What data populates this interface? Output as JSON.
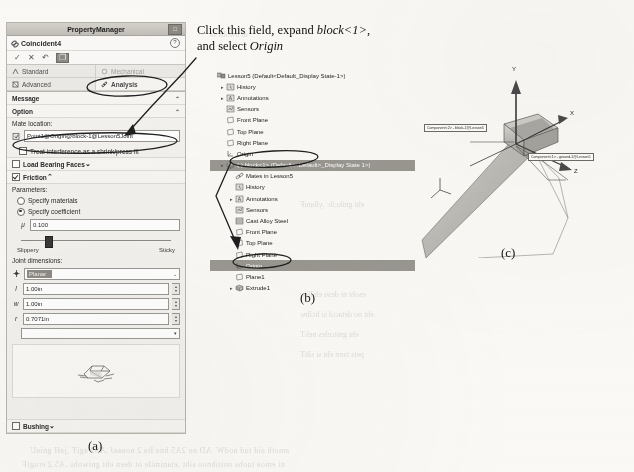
{
  "figure": {
    "caption_a": "(a)",
    "caption_b": "(b)",
    "caption_c": "(c)"
  },
  "instruction": {
    "line1_pre": "Click this field, expand ",
    "line1_em": "block<1>",
    "line1_post": ",",
    "line2_pre": "and select ",
    "line2_em": "Origin"
  },
  "property_manager": {
    "window_title": "PropertyManager",
    "pin_icon": "pin-icon",
    "mate_name": "Coincident4",
    "help_icon": "help-icon",
    "buttons": [
      {
        "name": "ok-button",
        "glyph": "✓"
      },
      {
        "name": "cancel-button",
        "glyph": "✕"
      },
      {
        "name": "undo-button",
        "glyph": "↶"
      },
      {
        "name": "mate-options-button",
        "glyph": "❐"
      }
    ],
    "tabs": [
      {
        "label": "Standard",
        "icon": "standard-mate-icon",
        "active": false
      },
      {
        "label": "Mechanical",
        "icon": "mechanical-mate-icon",
        "active": false
      },
      {
        "label": "Advanced",
        "icon": "advanced-mate-icon",
        "active": false
      },
      {
        "label": "Analysis",
        "icon": "analysis-mate-icon",
        "active": true
      }
    ],
    "message_section": {
      "title": "Message",
      "caret": "⌃"
    },
    "option_section": {
      "title": "Option",
      "caret": "⌃"
    },
    "mate_location": {
      "label": "Mate location:",
      "icon": "pick-location-icon",
      "value": "Point1@Origin@block-1@Lesson5Joint"
    },
    "shrink_fit": {
      "label": "Treat interference as a shrink/press fit",
      "checked": false
    },
    "load_bearing_faces": {
      "label": "Load Bearing Faces",
      "checked": false,
      "caret": "⌄"
    },
    "friction": {
      "label": "Friction",
      "checked": true,
      "caret": "⌃",
      "parameters_label": "Parameters:",
      "specify_materials": {
        "label": "Specify materials",
        "selected": false
      },
      "specify_coefficient": {
        "label": "Specify coefficient",
        "selected": true
      },
      "coefficient": {
        "symbol": "μ",
        "value": "0.100"
      },
      "slider": {
        "min_label": "Slippery",
        "max_label": "Sticky",
        "position_pct": 16
      }
    },
    "joint_dimensions": {
      "label": "Joint dimensions:",
      "type_icon": "joint-type-icon",
      "type_value": "Planar",
      "type_caret": "⌄",
      "fields": [
        {
          "symbol": "l",
          "value": "1.00in",
          "name": "length-field"
        },
        {
          "symbol": "w",
          "value": "1.00in",
          "name": "width-field"
        },
        {
          "symbol": "r",
          "value": "0.7071in",
          "name": "radius-field"
        }
      ]
    },
    "preview_icon": "joint-preview-thumbnail",
    "bushing": {
      "label": "Bushing",
      "checked": false,
      "caret": "⌄"
    }
  },
  "feature_tree": {
    "items": [
      {
        "indent": 0,
        "twisty": "",
        "icon": "assembly-icon",
        "label": "Lesson5  (Default<Default_Display State-1>)",
        "selected": false
      },
      {
        "indent": 1,
        "twisty": "▸",
        "icon": "history-icon",
        "label": "History",
        "selected": false
      },
      {
        "indent": 1,
        "twisty": "▸",
        "icon": "annotations-icon",
        "label": "Annotations",
        "selected": false
      },
      {
        "indent": 1,
        "twisty": "",
        "icon": "sensors-icon",
        "label": "Sensors",
        "selected": false
      },
      {
        "indent": 1,
        "twisty": "",
        "icon": "plane-icon",
        "label": "Front Plane",
        "selected": false
      },
      {
        "indent": 1,
        "twisty": "",
        "icon": "plane-icon",
        "label": "Top Plane",
        "selected": false
      },
      {
        "indent": 1,
        "twisty": "",
        "icon": "plane-icon",
        "label": "Right Plane",
        "selected": false
      },
      {
        "indent": 1,
        "twisty": "",
        "icon": "origin-icon",
        "label": "Origin",
        "selected": false
      },
      {
        "indent": 1,
        "twisty": "▸",
        "icon": "part-icon",
        "label": "(-) block<1>  (Default<<Default>_Display State 1>)",
        "selected": true
      },
      {
        "indent": 2,
        "twisty": "",
        "icon": "mates-icon",
        "label": "Mates in Lesson5",
        "selected": false
      },
      {
        "indent": 2,
        "twisty": "",
        "icon": "history-icon",
        "label": "History",
        "selected": false
      },
      {
        "indent": 2,
        "twisty": "▸",
        "icon": "annotations-icon",
        "label": "Annotations",
        "selected": false
      },
      {
        "indent": 2,
        "twisty": "",
        "icon": "sensors-icon",
        "label": "Sensors",
        "selected": false
      },
      {
        "indent": 2,
        "twisty": "",
        "icon": "material-icon",
        "label": "Cast Alloy Steel",
        "selected": false
      },
      {
        "indent": 2,
        "twisty": "",
        "icon": "plane-icon",
        "label": "Front Plane",
        "selected": false
      },
      {
        "indent": 2,
        "twisty": "",
        "icon": "plane-icon",
        "label": "Top Plane",
        "selected": false
      },
      {
        "indent": 2,
        "twisty": "",
        "icon": "plane-icon",
        "label": "Right Plane",
        "selected": false
      },
      {
        "indent": 2,
        "twisty": "",
        "icon": "origin-icon",
        "label": "Origin",
        "selected": true
      },
      {
        "indent": 2,
        "twisty": "",
        "icon": "plane-icon",
        "label": "Plane1",
        "selected": false
      },
      {
        "indent": 2,
        "twisty": "▸",
        "icon": "extrude-icon",
        "label": "Extrude1",
        "selected": false
      }
    ]
  },
  "viewport": {
    "axes": [
      {
        "label": "Y",
        "name": "axis-y-label"
      },
      {
        "label": "X",
        "name": "axis-x-label"
      },
      {
        "label": "Z",
        "name": "axis-z-label"
      }
    ],
    "callouts": [
      {
        "text": "Component<2> - block-1@Lesson5",
        "name": "callout-block"
      },
      {
        "text": "Component<1> - ground-1@Lesson5",
        "name": "callout-ground"
      }
    ]
  },
  "colors": {
    "panel_bg": "#f3f2ef",
    "title_bar": "#c2bfb8",
    "selection": "#9a9791",
    "paper": "#fbfaf7",
    "ink": "#1a1a1a"
  }
}
